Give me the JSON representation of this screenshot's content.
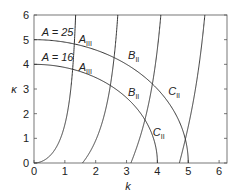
{
  "chart_data": {
    "type": "line",
    "title": "",
    "xlabel": "k",
    "ylabel": "κ",
    "xlim": [
      0,
      6.25
    ],
    "ylim": [
      0,
      6
    ],
    "xticks": [
      "0",
      "1",
      "2",
      "3",
      "4",
      "5",
      "6"
    ],
    "yticks": [
      "0",
      "1",
      "2",
      "3",
      "4",
      "5",
      "6"
    ],
    "grid": false,
    "series": [
      {
        "name": "A = 25",
        "kind": "circle",
        "radius": 5
      },
      {
        "name": "A = 16",
        "kind": "circle",
        "radius": 4
      },
      {
        "name": "branch 1",
        "kind": "k tan k",
        "k_range": [
          0,
          1.5708
        ]
      },
      {
        "name": "branch 2",
        "kind": "-k cot k",
        "k_range": [
          1.5708,
          3.1416
        ]
      },
      {
        "name": "branch 3",
        "kind": "k tan k",
        "k_range": [
          3.1416,
          4.7124
        ]
      },
      {
        "name": "branch 4",
        "kind": "-k cot k",
        "k_range": [
          4.7124,
          6.2832
        ]
      }
    ],
    "annotations": [
      {
        "text": "A = 25",
        "x": 0.25,
        "y": 5.15
      },
      {
        "text": "A = 16",
        "x": 0.25,
        "y": 4.15
      },
      {
        "text": "A",
        "sub": "III",
        "x": 1.45,
        "y": 4.85
      },
      {
        "text": "A",
        "sub": "III",
        "x": 1.45,
        "y": 3.75
      },
      {
        "text": "B",
        "sub": "II",
        "x": 3.05,
        "y": 4.2
      },
      {
        "text": "B",
        "sub": "II",
        "x": 3.05,
        "y": 2.7
      },
      {
        "text": "C",
        "sub": "II",
        "x": 4.35,
        "y": 2.75
      },
      {
        "text": "C",
        "sub": "II",
        "x": 3.85,
        "y": 1.1
      }
    ]
  }
}
